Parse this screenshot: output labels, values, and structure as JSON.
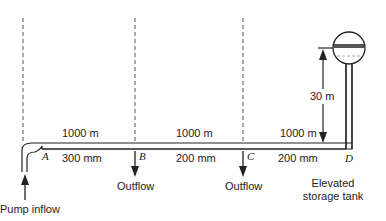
{
  "diagram": {
    "type": "pipe-network",
    "segments": [
      {
        "from": "A",
        "to": "B",
        "length": "1000 m",
        "diameter": "300 mm"
      },
      {
        "from": "B",
        "to": "C",
        "length": "1000 m",
        "diameter": "200 mm"
      },
      {
        "from": "C",
        "to": "D",
        "length": "1000 m",
        "diameter": "200 mm"
      }
    ],
    "nodes": {
      "A": "A",
      "B": "B",
      "C": "C",
      "D": "D"
    },
    "labels": {
      "pump_inflow": "Pump inflow",
      "outflow_b": "Outflow",
      "outflow_c": "Outflow",
      "tank_line1": "Elevated",
      "tank_line2": "storage tank",
      "elevation": "30 m"
    },
    "colors": {
      "line": "#222222",
      "dashed": "#555555"
    }
  }
}
